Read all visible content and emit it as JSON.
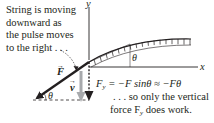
{
  "figure": {
    "caption_lines": [
      "String is moving",
      "downward as",
      "the pulse moves",
      "to the right . . ."
    ],
    "axes": {
      "x_label": "x",
      "y_label": "y"
    },
    "angle_label": "θ",
    "force_label": "F",
    "velocity_label": "v",
    "vertical_force_label": "F",
    "vertical_force_subscript": "y",
    "equation": {
      "lhs": "F",
      "lhs_subscript": "y",
      "rhs": "= −F sinθ ≈ −Fθ"
    },
    "note_lines": [
      ". . . so only the vertical",
      "force F"
    ],
    "note_subscript": "y",
    "note_tail": " does work.",
    "colors": {
      "ink": "#231f20",
      "velocity_arrow": "#a7a9ac",
      "hatch": "#231f20"
    }
  }
}
